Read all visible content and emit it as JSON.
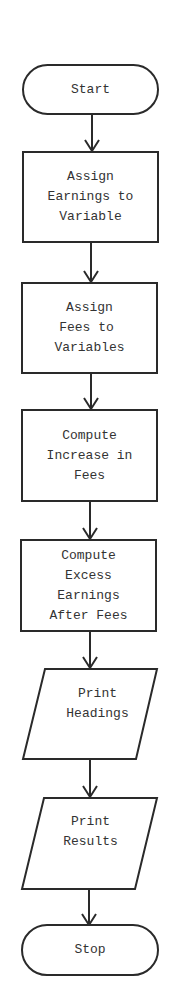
{
  "diagram": {
    "type": "flowchart",
    "nodes": [
      {
        "id": "start",
        "shape": "terminal",
        "lines": [
          "Start"
        ]
      },
      {
        "id": "assign-earnings",
        "shape": "process",
        "lines": [
          "Assign",
          "Earnings to",
          "Variable"
        ]
      },
      {
        "id": "assign-fees",
        "shape": "process",
        "lines": [
          "Assign",
          "Fees to",
          "Variables"
        ]
      },
      {
        "id": "compute-increase",
        "shape": "process",
        "lines": [
          "Compute",
          "Increase in",
          "Fees"
        ]
      },
      {
        "id": "compute-excess",
        "shape": "process",
        "lines": [
          "Compute",
          "Excess",
          "Earnings",
          "After Fees"
        ]
      },
      {
        "id": "print-headings",
        "shape": "input-output",
        "lines": [
          "Print",
          "Headings"
        ]
      },
      {
        "id": "print-results",
        "shape": "input-output",
        "lines": [
          "Print",
          "Results"
        ]
      },
      {
        "id": "stop",
        "shape": "terminal",
        "lines": [
          "Stop"
        ]
      }
    ],
    "edges": [
      {
        "from": "start",
        "to": "assign-earnings"
      },
      {
        "from": "assign-earnings",
        "to": "assign-fees"
      },
      {
        "from": "assign-fees",
        "to": "compute-increase"
      },
      {
        "from": "compute-increase",
        "to": "compute-excess"
      },
      {
        "from": "compute-excess",
        "to": "print-headings"
      },
      {
        "from": "print-headings",
        "to": "print-results"
      },
      {
        "from": "print-results",
        "to": "stop"
      }
    ],
    "colors": {
      "stroke": "#2a2a2a",
      "text": "#333333",
      "background": "#ffffff"
    }
  }
}
